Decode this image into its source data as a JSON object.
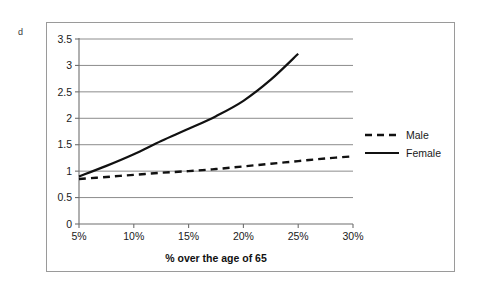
{
  "panel": {
    "letter": "d"
  },
  "colors": {
    "series_line": "#111111",
    "gridline": "#8c8c8c",
    "axis": "#6f6f6f",
    "frame": "#9a9a9a",
    "background": "#ffffff",
    "text": "#1a1a1a"
  },
  "legend": {
    "position": "right",
    "entries": [
      {
        "label": "Male",
        "style": "dashed"
      },
      {
        "label": "Female",
        "style": "solid"
      }
    ]
  },
  "chart_data": {
    "type": "line",
    "title": "",
    "subtitle": "",
    "xlabel": "% over the age of 65",
    "ylabel": "",
    "xlim": [
      5,
      30
    ],
    "ylim": [
      0,
      3.5
    ],
    "grid": true,
    "x_ticks": [
      5,
      10,
      15,
      20,
      25,
      30
    ],
    "x_tick_labels": [
      "5%",
      "10%",
      "15%",
      "20%",
      "25%",
      "30%"
    ],
    "y_ticks": [
      0,
      0.5,
      1,
      1.5,
      2,
      2.5,
      3,
      3.5
    ],
    "y_tick_labels": [
      "0",
      "0.5",
      "1",
      "1.5",
      "2",
      "2.5",
      "3",
      "3.5"
    ],
    "series": [
      {
        "name": "Male",
        "style": "dashed",
        "x": [
          5,
          7.5,
          10,
          12.5,
          15,
          17.5,
          20,
          22.5,
          25,
          27.5,
          30
        ],
        "values": [
          0.85,
          0.89,
          0.93,
          0.97,
          1.0,
          1.04,
          1.09,
          1.14,
          1.19,
          1.24,
          1.28
        ]
      },
      {
        "name": "Female",
        "style": "solid",
        "x": [
          5,
          7.5,
          10,
          12.5,
          15,
          17.5,
          20,
          22.5,
          25
        ],
        "values": [
          0.9,
          1.1,
          1.32,
          1.57,
          1.8,
          2.04,
          2.33,
          2.73,
          3.22
        ]
      }
    ]
  }
}
